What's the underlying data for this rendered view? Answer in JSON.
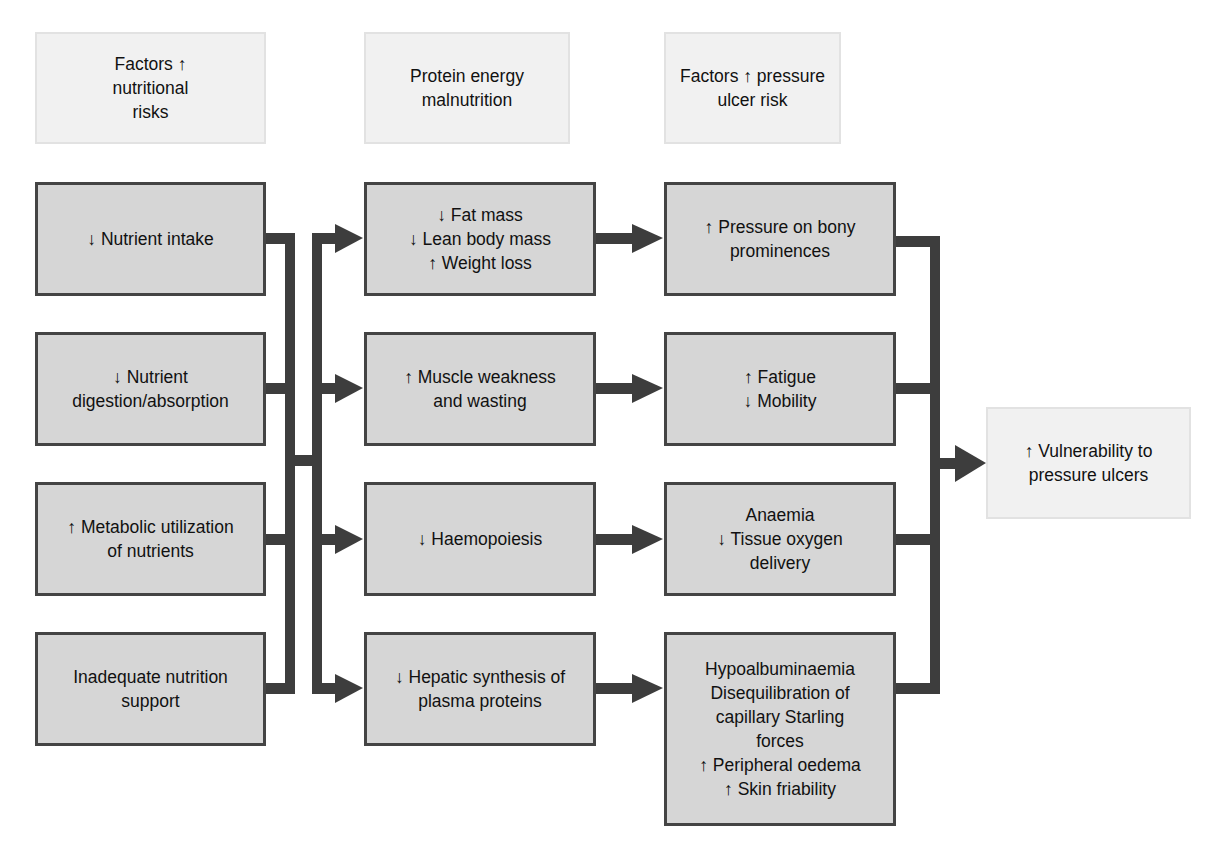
{
  "colors": {
    "node_fill": "#d6d6d6",
    "node_border": "#444444",
    "header_fill": "#f1f1f1",
    "connector": "#3d3d3d"
  },
  "headers": [
    {
      "label": "Factors ↑\nnutritional\nrisks"
    },
    {
      "label": "Protein energy\nmalnutrition"
    },
    {
      "label": "Factors ↑ pressure\nulcer risk"
    }
  ],
  "column1": [
    {
      "label": "↓ Nutrient intake"
    },
    {
      "label": "↓ Nutrient\ndigestion/absorption"
    },
    {
      "label": "↑ Metabolic utilization\nof nutrients"
    },
    {
      "label": "Inadequate nutrition\nsupport"
    }
  ],
  "column2": [
    {
      "label": "↓ Fat mass\n↓ Lean body mass\n↑ Weight loss"
    },
    {
      "label": "↑ Muscle weakness\nand wasting"
    },
    {
      "label": "↓ Haemopoiesis"
    },
    {
      "label": "↓ Hepatic synthesis of\nplasma proteins"
    }
  ],
  "column3": [
    {
      "label": "↑ Pressure on bony\nprominences"
    },
    {
      "label": "↑ Fatigue\n↓ Mobility"
    },
    {
      "label": "Anaemia\n↓ Tissue oxygen\ndelivery"
    },
    {
      "label": "Hypoalbuminaemia\nDisequilibration of\ncapillary Starling\nforces\n↑ Peripheral oedema\n↑ Skin friability"
    }
  ],
  "outcome": {
    "label": "↑ Vulnerability to\npressure ulcers"
  }
}
